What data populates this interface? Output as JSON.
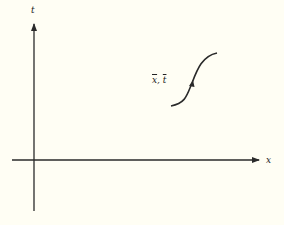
{
  "diagram": {
    "axes": {
      "vertical_label": "t",
      "horizontal_label": "x"
    },
    "curve": {
      "label_x": "x",
      "label_sep": ", ",
      "label_t": "t",
      "description": "S-shaped characteristic curve through point (x̄, t̄)"
    },
    "colors": {
      "background": "#fffef4",
      "stroke": "#2a2a2a"
    }
  }
}
